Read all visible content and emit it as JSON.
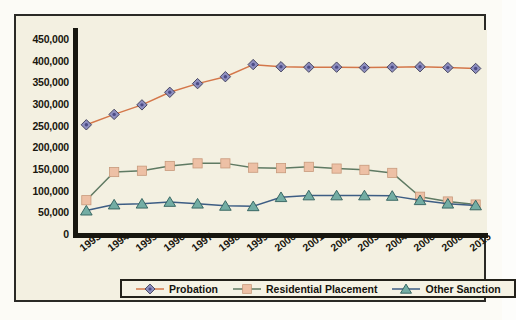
{
  "chart_data": {
    "type": "line",
    "title": "",
    "subtitle": "",
    "xlabel": "",
    "ylabel": "",
    "grid": false,
    "legend_position": "bottom",
    "categories": [
      "1993",
      "1994",
      "1995",
      "1996",
      "1997",
      "1998",
      "1999",
      "2000",
      "2001",
      "2002",
      "2003",
      "2004",
      "2006",
      "2008",
      "2015"
    ],
    "ylim": [
      0,
      450000
    ],
    "yticks": [
      450000,
      400000,
      350000,
      300000,
      250000,
      200000,
      150000,
      100000,
      50000,
      0
    ],
    "ytick_labels": [
      "450,000",
      "400,000",
      "350,000",
      "300,000",
      "250,000",
      "200,000",
      "150,000",
      "100,000",
      "50,000",
      "0"
    ],
    "series": [
      {
        "name": "Probation",
        "marker": "diamond",
        "color": "#8e8fc0",
        "line_color": "#d4774a",
        "values": [
          252000,
          276000,
          298000,
          327000,
          347000,
          363000,
          391000,
          386000,
          385000,
          385000,
          384000,
          385000,
          386000,
          384000,
          382000
        ]
      },
      {
        "name": "Residential Placement",
        "marker": "square",
        "color": "#edc0a5",
        "line_color": "#5f7a63",
        "values": [
          78000,
          143000,
          146000,
          157000,
          163000,
          163000,
          153000,
          152000,
          155000,
          151000,
          148000,
          141000,
          86000,
          75000,
          68000
        ]
      },
      {
        "name": "Other Sanction",
        "marker": "triangle",
        "color": "#73ada4",
        "line_color": "#3d5d84",
        "values": [
          54000,
          68000,
          70000,
          74000,
          70000,
          65000,
          64000,
          85000,
          89000,
          89000,
          89000,
          88000,
          78000,
          70000,
          66000
        ]
      }
    ]
  },
  "legend": {
    "items": [
      {
        "label": "Probation",
        "marker": "diamond-marker"
      },
      {
        "label": "Residential Placement",
        "marker": "square-marker"
      },
      {
        "label": "Other Sanction",
        "marker": "triangle-marker"
      }
    ]
  },
  "colors": {
    "frame_border": "#2b2a26",
    "plot_background": "#f3f0e1",
    "axis": "#17160f",
    "probation_marker": "#8e8fc0",
    "probation_line": "#d4774a",
    "residential_marker": "#edc0a5",
    "residential_line": "#5f7a63",
    "other_marker": "#73ada4",
    "other_line": "#3d5d84"
  }
}
